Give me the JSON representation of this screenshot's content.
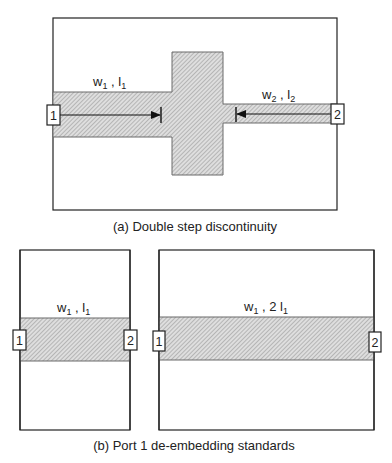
{
  "figure": {
    "colors": {
      "outline": "#222222",
      "strip_fill": "#d9d9d9",
      "hatch": "#8a8a8a",
      "strip_edge": "#6a6a6a",
      "text": "#222222"
    },
    "panel_a": {
      "caption": "(a) Double step discontinuity",
      "line1_label": {
        "w": "w",
        "w_sub": "1",
        "sep": " , ",
        "l": "l",
        "l_sub": "1"
      },
      "line2_label": {
        "w": "w",
        "w_sub": "2",
        "sep": " , ",
        "l": "l",
        "l_sub": "2"
      },
      "port1": "1",
      "port2": "2"
    },
    "panel_b": {
      "caption": "(b) Port 1 de-embedding standards",
      "standard1": {
        "label": {
          "w": "w",
          "w_sub": "1",
          "sep": " , ",
          "l": "l",
          "l_sub": "1",
          "prefix": ""
        },
        "port1": "1",
        "port2": "2"
      },
      "standard2": {
        "label": {
          "w": "w",
          "w_sub": "1",
          "sep": " , ",
          "l": "l",
          "l_sub": "1",
          "prefix": "2 "
        },
        "port1": "1",
        "port2": "2"
      }
    }
  }
}
